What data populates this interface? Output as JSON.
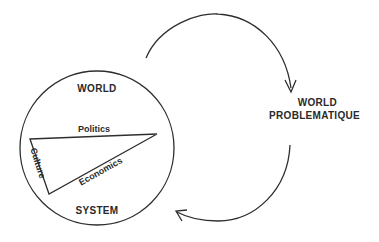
{
  "diagram": {
    "type": "cycle-diagram",
    "system": {
      "title_top": "WORLD",
      "title_bottom": "SYSTEM",
      "shape": "circle",
      "triangle_edges": {
        "top": "Politics",
        "left": "Culture",
        "diagonal": "Economics"
      }
    },
    "target": {
      "line1": "WORLD",
      "line2": "PROBLEMATIQUE"
    },
    "arrows": [
      {
        "from": "world-system",
        "to": "world-problematique",
        "direction": "clockwise-upper"
      },
      {
        "from": "world-problematique",
        "to": "world-system",
        "direction": "clockwise-lower"
      }
    ],
    "colors": {
      "line": "#2e2e2e",
      "text": "#2a2a2a",
      "background": "#ffffff"
    }
  }
}
